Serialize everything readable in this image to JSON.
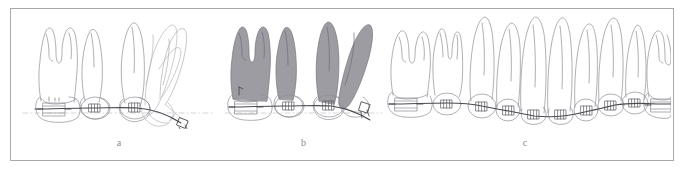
{
  "figure": {
    "type": "dental-orthodontic-illustration",
    "background_color": "#ffffff",
    "border_color": "#a8a8a8",
    "outline_color": "#8a8a92",
    "shading_color": "#9a9a9a",
    "wire_color": "#555558",
    "reference_line_color": "#bfbfbf",
    "panels": [
      {
        "id": "a",
        "caption": "a",
        "description": "Lateral view of posterior teeth with brackets and a continuous archwire; superimposed ghost outlines show pre-treatment tipped tooth positions and the post-treatment upright positions.",
        "tooth_count": 4,
        "has_shading": false,
        "has_reference_line": true,
        "has_ghost_outlines": true
      },
      {
        "id": "b",
        "caption": "b",
        "description": "Lateral view with grey-shaded tooth crowns and roots indicating the displaced/tipped teeth, bonded brackets, molar band and an archwire descending toward the distal end.",
        "tooth_count": 4,
        "has_shading": true,
        "has_reference_line": true,
        "has_ghost_outlines": false
      },
      {
        "id": "c",
        "caption": "c",
        "description": "Full dental arch in frontal/labial view with brackets bonded on every tooth, molar bands at both ends and a continuous levelled archwire.",
        "tooth_count": 12,
        "has_shading": false,
        "has_reference_line": false,
        "has_ghost_outlines": false
      }
    ]
  }
}
